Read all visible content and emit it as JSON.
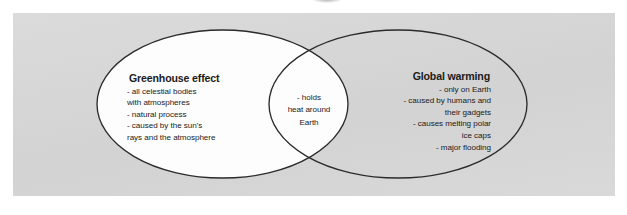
{
  "diagram": {
    "type": "venn",
    "title": "",
    "page_background": "#ffffff",
    "panel_background": "#d6d6d6",
    "ellipse_fill": "#fdfdfd",
    "ellipse_stroke": "#2b2b2b",
    "text_color": "#1b1b1b",
    "sets": {
      "left": {
        "title": "Greenhouse effect",
        "items": [
          "- all celestial bodies",
          "with atmospheres",
          "- natural process",
          "- caused by the sun's",
          "rays and the atmosphere"
        ],
        "body": "- all celestial bodies\nwith atmospheres\n- natural process\n- caused by the sun's\nrays and the atmosphere",
        "align": "left"
      },
      "right": {
        "title": "Global warming",
        "items": [
          "- only on Earth",
          "- caused by humans and",
          "their gadgets",
          "- causes melting polar",
          "ice caps",
          "- major flooding"
        ],
        "body": "- only on Earth\n- caused by humans and\ntheir gadgets\n- causes melting polar\nice caps\n- major flooding",
        "align": "right"
      },
      "intersection": {
        "title": "",
        "items": [
          "- holds",
          "heat around",
          "Earth"
        ],
        "body": "- holds\nheat around\nEarth",
        "align": "center"
      }
    }
  }
}
